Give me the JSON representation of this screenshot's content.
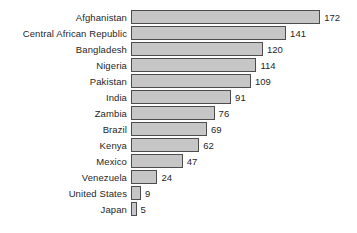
{
  "chart_data": {
    "type": "bar",
    "orientation": "horizontal",
    "title": "",
    "subtitle": "",
    "xlabel": "",
    "ylabel": "",
    "xlim": [
      0,
      172
    ],
    "grid": false,
    "legend": null,
    "categories": [
      "Afghanistan",
      "Central African Republic",
      "Bangladesh",
      "Nigeria",
      "Pakistan",
      "India",
      "Zambia",
      "Brazil",
      "Kenya",
      "Mexico",
      "Venezuela",
      "United States",
      "Japan"
    ],
    "values": [
      172,
      141,
      120,
      114,
      109,
      91,
      76,
      69,
      62,
      47,
      24,
      9,
      5
    ],
    "value_labels": [
      "172",
      "141",
      "120",
      "114",
      "109",
      "91",
      "76",
      "69",
      "62",
      "47",
      "24",
      "9",
      "5"
    ],
    "data_labels_shown": true,
    "bars": [
      {
        "category": "Afghanistan",
        "value": 172,
        "label": "172"
      },
      {
        "category": "Central African Republic",
        "value": 141,
        "label": "141"
      },
      {
        "category": "Bangladesh",
        "value": 120,
        "label": "120"
      },
      {
        "category": "Nigeria",
        "value": 114,
        "label": "114"
      },
      {
        "category": "Pakistan",
        "value": 109,
        "label": "109"
      },
      {
        "category": "India",
        "value": 91,
        "label": "91"
      },
      {
        "category": "Zambia",
        "value": 76,
        "label": "76"
      },
      {
        "category": "Brazil",
        "value": 69,
        "label": "69"
      },
      {
        "category": "Kenya",
        "value": 62,
        "label": "62"
      },
      {
        "category": "Mexico",
        "value": 47,
        "label": "47"
      },
      {
        "category": "Venezuela",
        "value": 24,
        "label": "24"
      },
      {
        "category": "United States",
        "value": 9,
        "label": "9"
      },
      {
        "category": "Japan",
        "value": 5,
        "label": "5"
      }
    ],
    "colors": {
      "bar_fill": "#c6c6c6",
      "bar_border": "#4d4d4d",
      "background": "#ffffff",
      "text": "#1f1f1f"
    },
    "scale": {
      "plot_left_px": 133,
      "px_per_unit": 1.1
    }
  }
}
